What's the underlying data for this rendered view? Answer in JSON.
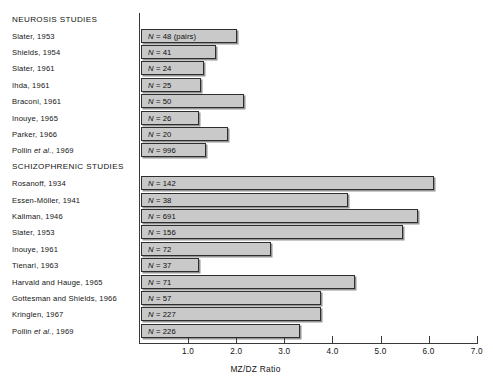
{
  "chart_data": {
    "type": "bar",
    "orientation": "horizontal",
    "title": "",
    "xlabel": "MZ/DZ Ratio",
    "ylabel": "",
    "xlim": [
      0,
      7.2
    ],
    "xticks": [
      1.0,
      2.0,
      3.0,
      4.0,
      5.0,
      6.0,
      7.0
    ],
    "xtick_labels": [
      "1.0",
      "2.0",
      "3.0",
      "4.0",
      "5.0",
      "6.0",
      "7.0"
    ],
    "grid": false,
    "legend": null,
    "groups": [
      {
        "heading": "NEUROSIS STUDIES",
        "categories": [
          "Slater, 1953",
          "Shields, 1954",
          "Slater, 1961",
          "Ihda, 1961",
          "Braconi, 1961",
          "Inouye, 1965",
          "Parker, 1966",
          "Pollin et al., 1969"
        ],
        "values": [
          2.0,
          1.55,
          1.3,
          1.25,
          2.15,
          1.2,
          1.8,
          1.35
        ],
        "annotations": [
          "N = 48 (pairs)",
          "N = 41",
          "N = 24",
          "N = 25",
          "N = 50",
          "N = 26",
          "N = 20",
          "N = 996"
        ]
      },
      {
        "heading": "SCHIZOPHRENIC STUDIES",
        "categories": [
          "Rosanoff, 1934",
          "Essen-Möller, 1941",
          "Kallman, 1946",
          "Slater, 1953",
          "Inouye, 1961",
          "Tienari, 1963",
          "Harvald and Hauge, 1965",
          "Gottesman and Shields, 1966",
          "Kringlen, 1967",
          "Pollin et al., 1969"
        ],
        "values": [
          6.1,
          4.3,
          5.75,
          5.45,
          2.7,
          1.2,
          4.45,
          3.75,
          3.75,
          3.3
        ],
        "annotations": [
          "N = 142",
          "N = 38",
          "N = 691",
          "N = 156",
          "N = 72",
          "N = 37",
          "N = 71",
          "N = 57",
          "N = 227",
          "N = 226"
        ]
      }
    ]
  },
  "colors": {
    "bar_fill": "#c9c9c9",
    "bar_stroke": "#2e2e2e",
    "axis": "#3a3a3a",
    "text": "#141414",
    "background": "#ffffff"
  }
}
